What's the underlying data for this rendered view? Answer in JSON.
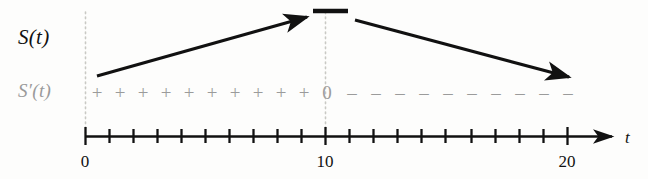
{
  "figure": {
    "background_color": "#fdfdfc",
    "axis_color": "#111111",
    "sign_color": "#9b9b9b",
    "curve_color": "#111111",
    "guide_color": "#c9c9c4"
  },
  "labels": {
    "function_label": "S(t)",
    "derivative_label": "S′(t)",
    "axis_variable": "t"
  },
  "axis": {
    "ticks": [
      {
        "value": 0,
        "label": "0",
        "x": 85
      },
      {
        "value": 1,
        "label": "",
        "x": 109
      },
      {
        "value": 2,
        "label": "",
        "x": 133
      },
      {
        "value": 3,
        "label": "",
        "x": 157
      },
      {
        "value": 4,
        "label": "",
        "x": 181
      },
      {
        "value": 5,
        "label": "",
        "x": 205
      },
      {
        "value": 6,
        "label": "",
        "x": 229
      },
      {
        "value": 7,
        "label": "",
        "x": 253
      },
      {
        "value": 8,
        "label": "",
        "x": 277
      },
      {
        "value": 9,
        "label": "",
        "x": 301
      },
      {
        "value": 10,
        "label": "10",
        "x": 325
      },
      {
        "value": 11,
        "label": "",
        "x": 349
      },
      {
        "value": 12,
        "label": "",
        "x": 373
      },
      {
        "value": 13,
        "label": "",
        "x": 397
      },
      {
        "value": 14,
        "label": "",
        "x": 421
      },
      {
        "value": 15,
        "label": "",
        "x": 445
      },
      {
        "value": 16,
        "label": "",
        "x": 471
      },
      {
        "value": 17,
        "label": "",
        "x": 495
      },
      {
        "value": 18,
        "label": "",
        "x": 519
      },
      {
        "value": 19,
        "label": "",
        "x": 543
      },
      {
        "value": 20,
        "label": "20",
        "x": 567
      }
    ],
    "axis_y": 136,
    "axis_start_x": 85,
    "axis_end_x": 618,
    "labeled_ticks": [
      "0",
      "10",
      "20"
    ]
  },
  "sign_row": {
    "symbols": [
      {
        "glyph": "+",
        "x": 97
      },
      {
        "glyph": "+",
        "x": 120
      },
      {
        "glyph": "+",
        "x": 143
      },
      {
        "glyph": "+",
        "x": 166
      },
      {
        "glyph": "+",
        "x": 189
      },
      {
        "glyph": "+",
        "x": 212
      },
      {
        "glyph": "+",
        "x": 235
      },
      {
        "glyph": "+",
        "x": 258
      },
      {
        "glyph": "+",
        "x": 281
      },
      {
        "glyph": "+",
        "x": 304
      },
      {
        "glyph": "0",
        "x": 327
      },
      {
        "glyph": "–",
        "x": 352
      },
      {
        "glyph": "–",
        "x": 376
      },
      {
        "glyph": "–",
        "x": 400
      },
      {
        "glyph": "–",
        "x": 424
      },
      {
        "glyph": "–",
        "x": 448
      },
      {
        "glyph": "–",
        "x": 472
      },
      {
        "glyph": "–",
        "x": 496
      },
      {
        "glyph": "–",
        "x": 520
      },
      {
        "glyph": "–",
        "x": 544
      },
      {
        "glyph": "–",
        "x": 568
      }
    ],
    "positive_count": 10,
    "negative_count": 10,
    "zero_at": 10
  },
  "chart_data": {
    "type": "line",
    "xlabel": "t",
    "ylabel": "",
    "xlim": [
      0,
      20
    ],
    "grid": false,
    "annotations": [
      {
        "text": "S(t)",
        "role": "function-label"
      },
      {
        "text": "S′(t)",
        "role": "derivative-label"
      },
      {
        "text": "0",
        "role": "critical-point-sign",
        "x": 10
      },
      {
        "text": "10",
        "role": "x-tick",
        "x": 10
      },
      {
        "text": "20",
        "role": "x-tick",
        "x": 20
      }
    ],
    "series": [
      {
        "name": "S(t) increasing arrow",
        "type": "arrow",
        "x": [
          0.5,
          9.7
        ],
        "y_pixel": [
          75,
          18
        ],
        "direction": "up-right"
      },
      {
        "name": "S(t) maximum plateau",
        "type": "segment",
        "x": [
          9.5,
          11.0
        ],
        "y_pixel": [
          11,
          11
        ]
      },
      {
        "name": "S(t) decreasing arrow",
        "type": "arrow",
        "x": [
          11.3,
          20.4
        ],
        "y_pixel": [
          20,
          78
        ],
        "direction": "down-right"
      }
    ],
    "guides": [
      {
        "type": "vertical-dotted",
        "x": 0
      },
      {
        "type": "vertical-dotted",
        "x": 10
      }
    ]
  }
}
